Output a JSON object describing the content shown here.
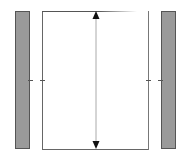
{
  "diagram": {
    "colors": {
      "panel_fill": "#9a9a9a",
      "panel_border": "#555555",
      "box_border": "#666666",
      "arrow": "#111111",
      "arrow_shaft": "#aaaaaa",
      "background": "#ffffff"
    },
    "elements": {
      "left_panel": {
        "label": "left-panel"
      },
      "right_panel": {
        "label": "right-panel"
      },
      "center_box": {
        "label": "center-box"
      },
      "dimension_arrow": {
        "label": "vertical-double-arrow",
        "direction": "up-down"
      },
      "ticks": [
        {
          "side": "left-outer",
          "y": 80
        },
        {
          "side": "left-inner",
          "y": 80
        },
        {
          "side": "right-inner",
          "y": 80
        },
        {
          "side": "right-outer",
          "y": 80
        }
      ]
    }
  }
}
